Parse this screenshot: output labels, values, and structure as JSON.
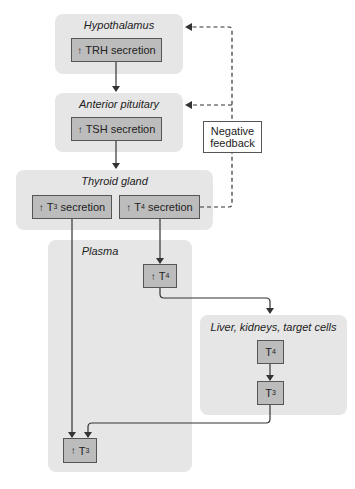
{
  "regions": {
    "hypothalamus": {
      "title": "Hypothalamus"
    },
    "anterior_pituitary": {
      "title": "Anterior pituitary"
    },
    "thyroid_gland": {
      "title": "Thyroid gland"
    },
    "plasma": {
      "title": "Plasma"
    },
    "liver": {
      "title": "Liver, kidneys, target cells"
    }
  },
  "nodes": {
    "trh": {
      "prefix": "↑",
      "label": "TRH secretion"
    },
    "tsh": {
      "prefix": "↑",
      "label": "TSH secretion"
    },
    "t3_secretion": {
      "prefix": "↑",
      "base": "T",
      "sub": "3",
      "suffix": " secretion"
    },
    "t4_secretion": {
      "prefix": "↑",
      "base": "T",
      "sub": "4",
      "suffix": " secretion"
    },
    "plasma_t4": {
      "prefix": "↑",
      "base": "T",
      "sub": "4"
    },
    "liver_t4": {
      "base": "T",
      "sub": "4"
    },
    "liver_t3": {
      "base": "T",
      "sub": "3"
    },
    "plasma_t3": {
      "prefix": "↑",
      "base": "T",
      "sub": "3"
    }
  },
  "feedback": {
    "line1": "Negative",
    "line2": "feedback"
  },
  "colors": {
    "region_bg": "#e6e6e6",
    "node_bg": "#bcbcbc",
    "line": "#333333"
  }
}
